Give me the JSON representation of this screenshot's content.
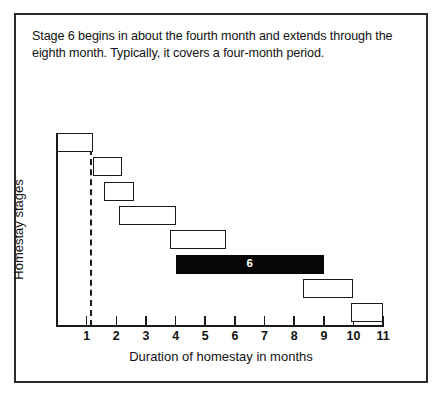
{
  "caption": {
    "text": "Stage 6 begins in about the fourth month and extends through the eighth month. Typically, it covers a four-month period."
  },
  "chart_data": {
    "type": "bar",
    "orientation": "horizontal",
    "title": "",
    "xlabel": "Duration of homestay in months",
    "ylabel": "Homestay stages",
    "xlim": [
      0,
      11
    ],
    "xticks": [
      1,
      2,
      3,
      4,
      5,
      6,
      7,
      8,
      9,
      10,
      11
    ],
    "xtick_labels": [
      "1",
      "2",
      "3",
      "4",
      "5",
      "6",
      "7",
      "8",
      "9",
      "10",
      "11"
    ],
    "grid": false,
    "legend": null,
    "annotations": [
      {
        "name": "reference-dashed-line",
        "x": 1.1,
        "style": "dashed-vertical"
      }
    ],
    "categories": [
      "Stage 1",
      "Stage 2",
      "Stage 3",
      "Stage 4",
      "Stage 5",
      "Stage 6",
      "Stage 7",
      "Stage 8"
    ],
    "bars": [
      {
        "stage": 1,
        "start": 0.0,
        "end": 1.2,
        "label": "",
        "filled": false
      },
      {
        "stage": 2,
        "start": 1.2,
        "end": 2.2,
        "label": "",
        "filled": false
      },
      {
        "stage": 3,
        "start": 1.6,
        "end": 2.6,
        "label": "",
        "filled": false
      },
      {
        "stage": 4,
        "start": 2.1,
        "end": 4.0,
        "label": "",
        "filled": false
      },
      {
        "stage": 5,
        "start": 3.8,
        "end": 5.7,
        "label": "",
        "filled": false
      },
      {
        "stage": 6,
        "start": 4.0,
        "end": 9.0,
        "label": "6",
        "filled": true
      },
      {
        "stage": 7,
        "start": 8.3,
        "end": 10.0,
        "label": "",
        "filled": false
      },
      {
        "stage": 8,
        "start": 9.9,
        "end": 11.0,
        "label": "",
        "filled": false
      }
    ],
    "colors": {
      "bar_outline": "#1a1a1a",
      "bar_fill": "#ffffff",
      "highlight_fill": "#060606",
      "highlight_text": "#ffffff",
      "axis": "#1a1a1a",
      "frame": "#2b2b2b",
      "background": "#ffffff"
    }
  }
}
